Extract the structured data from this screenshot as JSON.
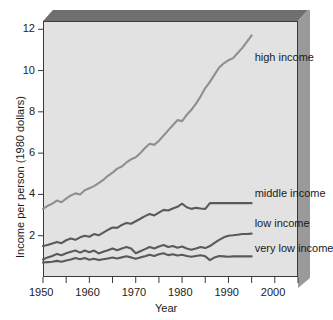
{
  "chart_data": {
    "type": "line",
    "title": "",
    "xlabel": "Year",
    "ylabel": "Income per person (1980 dollars)",
    "xlim": [
      1950,
      2005
    ],
    "ylim": [
      0,
      12.4
    ],
    "grid": false,
    "legend_position": "inline-right-of-line-ends",
    "xticks": [
      1950,
      1960,
      1970,
      1980,
      1990,
      2000
    ],
    "xticks_minor": [
      1955,
      1965,
      1975,
      1985,
      1995,
      2005
    ],
    "yticks": [
      2,
      4,
      6,
      8,
      10,
      12
    ],
    "colors": {
      "high_income": "#8f8f8f",
      "middle_income": "#5a5a5a",
      "low_income": "#5a5a5a",
      "very_low_income": "#5a5a5a",
      "plot_background": "#e2e2e2",
      "frame_top": "#6f6f6f",
      "frame_right": "#9a9a9a",
      "axis": "#3a3a3a"
    },
    "x": [
      1950,
      1951,
      1952,
      1953,
      1954,
      1955,
      1956,
      1957,
      1958,
      1959,
      1960,
      1961,
      1962,
      1963,
      1964,
      1965,
      1966,
      1967,
      1968,
      1969,
      1970,
      1971,
      1972,
      1973,
      1974,
      1975,
      1976,
      1977,
      1978,
      1979,
      1980,
      1981,
      1982,
      1983,
      1984,
      1985,
      1986,
      1987,
      1988,
      1989,
      1990,
      1991,
      1992,
      1993,
      1994,
      1995
    ],
    "series": [
      {
        "name": "high income",
        "label": "high income",
        "color": "#8f8f8f",
        "values": [
          3.3,
          3.45,
          3.55,
          3.7,
          3.62,
          3.8,
          3.95,
          4.05,
          4.0,
          4.2,
          4.3,
          4.4,
          4.55,
          4.7,
          4.9,
          5.05,
          5.25,
          5.35,
          5.55,
          5.7,
          5.8,
          6.0,
          6.25,
          6.45,
          6.4,
          6.6,
          6.85,
          7.1,
          7.35,
          7.6,
          7.55,
          7.85,
          8.1,
          8.4,
          8.75,
          9.15,
          9.45,
          9.8,
          10.15,
          10.35,
          10.5,
          10.6,
          10.85,
          11.1,
          11.4,
          11.7
        ]
      },
      {
        "name": "middle income",
        "label": "middle income",
        "color": "#5a5a5a",
        "values": [
          1.5,
          1.55,
          1.62,
          1.7,
          1.64,
          1.78,
          1.86,
          1.8,
          1.92,
          2.0,
          1.95,
          2.08,
          2.02,
          2.15,
          2.28,
          2.4,
          2.38,
          2.52,
          2.62,
          2.58,
          2.7,
          2.82,
          2.95,
          3.05,
          2.98,
          3.12,
          3.25,
          3.22,
          3.32,
          3.4,
          3.55,
          3.38,
          3.3,
          3.35,
          3.32,
          3.3,
          3.58,
          3.58,
          3.58,
          3.58,
          3.58,
          3.58,
          3.58,
          3.58,
          3.58,
          3.58
        ]
      },
      {
        "name": "low income",
        "label": "low income",
        "color": "#5a5a5a",
        "values": [
          0.85,
          0.95,
          1.02,
          1.12,
          1.05,
          1.15,
          1.22,
          1.28,
          1.18,
          1.28,
          1.2,
          1.28,
          1.14,
          1.22,
          1.3,
          1.38,
          1.3,
          1.38,
          1.45,
          1.38,
          1.15,
          1.25,
          1.35,
          1.45,
          1.38,
          1.48,
          1.55,
          1.45,
          1.5,
          1.42,
          1.48,
          1.38,
          1.32,
          1.38,
          1.45,
          1.4,
          1.5,
          1.65,
          1.8,
          1.92,
          2.0,
          2.02,
          2.05,
          2.08,
          2.08,
          2.1
        ]
      },
      {
        "name": "very low income",
        "label": "very low income",
        "color": "#5a5a5a",
        "values": [
          0.7,
          0.72,
          0.74,
          0.78,
          0.74,
          0.8,
          0.85,
          0.92,
          0.86,
          0.92,
          0.84,
          0.88,
          0.82,
          0.86,
          0.9,
          0.94,
          0.9,
          0.95,
          1.0,
          0.95,
          0.88,
          0.95,
          1.0,
          1.08,
          1.02,
          1.1,
          1.15,
          1.06,
          1.1,
          1.04,
          1.08,
          1.02,
          0.98,
          1.02,
          1.05,
          1.0,
          0.82,
          0.95,
          1.02,
          1.0,
          0.98,
          1.0,
          1.0,
          1.0,
          1.0,
          1.0
        ]
      }
    ],
    "annotations": [
      {
        "text": "high income",
        "x": 1995,
        "y": 10.6
      },
      {
        "text": "middle income",
        "x": 1995,
        "y": 4.0
      },
      {
        "text": "low income",
        "x": 1995,
        "y": 2.55
      },
      {
        "text": "very low income",
        "x": 1995,
        "y": 1.35
      }
    ]
  },
  "axes": {
    "x_title": "Year",
    "y_title": "Income per person (1980 dollars)",
    "x_tick_labels": [
      "1950",
      "1960",
      "1970",
      "1980",
      "1990",
      "2000"
    ],
    "y_tick_labels": [
      "2",
      "4",
      "6",
      "8",
      "10",
      "12"
    ]
  },
  "labels": {
    "high": "high income",
    "middle": "middle income",
    "low": "low income",
    "very_low": "very low income"
  }
}
